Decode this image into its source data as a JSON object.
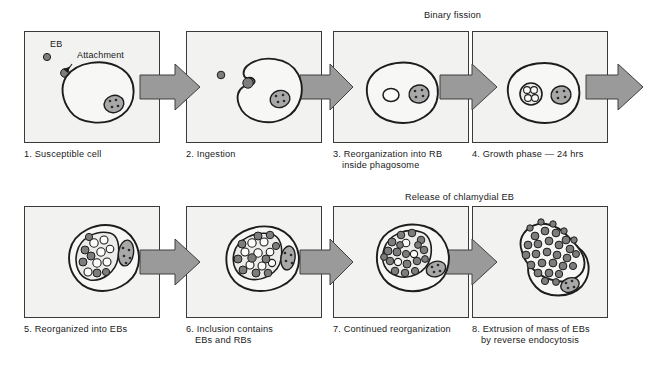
{
  "figure": {
    "title_visible": false,
    "rows": 2,
    "panels_per_row": 4
  },
  "colors": {
    "page_background": "#ffffff",
    "panel_background": "#f2f2f0",
    "panel_border": "#3a3a3a",
    "arrow_fill": "#9a9a9a",
    "arrow_stroke": "#3f3f3f",
    "cell_membrane_stroke": "#1d1d1d",
    "nucleus_fill": "#a8a8a8",
    "elementary_body_fill": "#7d7d7d",
    "reticulate_body_fill": "#fbfbfa",
    "text": "#1a1a1a"
  },
  "phase_labels": [
    {
      "text": "Binary fission",
      "row": 1
    },
    {
      "text": "Release of chlamydial EB",
      "row": 2
    }
  ],
  "annotations": [
    {
      "text": "EB",
      "panel": 1
    },
    {
      "text": "Attachment",
      "panel": 1
    }
  ],
  "panels": [
    {
      "number": "1.",
      "caption": "1. Susceptible cell",
      "caption_lines": [
        "1. Susceptible cell"
      ],
      "stage": "attachment",
      "contents": {
        "host_cell": 1,
        "nucleus": 1,
        "free_elementary_bodies": 1,
        "attached_elementary_bodies": 1,
        "inclusions": 0,
        "elementary_bodies_inside": 0,
        "reticulate_bodies_inside": 0
      }
    },
    {
      "number": "2.",
      "caption": "2. Ingestion",
      "caption_lines": [
        "2. Ingestion"
      ],
      "stage": "ingestion",
      "contents": {
        "host_cell": 1,
        "nucleus": 1,
        "free_elementary_bodies": 1,
        "engulfed_elementary_bodies": 1,
        "inclusions": 0,
        "elementary_bodies_inside": 0,
        "reticulate_bodies_inside": 0
      }
    },
    {
      "number": "3.",
      "caption": "3. Reorganization into RB inside phagosome",
      "caption_lines": [
        "3. Reorganization into RB",
        "inside phagosome"
      ],
      "stage": "reorganization-into-rb",
      "contents": {
        "host_cell": 1,
        "nucleus": 1,
        "phagosomes": 1,
        "elementary_bodies_inside": 0,
        "reticulate_bodies_inside": 1
      }
    },
    {
      "number": "4.",
      "caption": "4. Growth phase — 24 hrs",
      "caption_lines": [
        "4. Growth phase — 24 hrs"
      ],
      "stage": "growth-phase",
      "duration": "24 hrs",
      "contents": {
        "host_cell": 1,
        "nucleus": 1,
        "inclusions": 1,
        "dividing_reticulate_bodies": 4,
        "elementary_bodies_inside": 0
      }
    },
    {
      "number": "5.",
      "caption": "5. Reorganized into EBs",
      "caption_lines": [
        "5. Reorganized into EBs"
      ],
      "stage": "reorganized-into-ebs",
      "contents": {
        "host_cell": 1,
        "nucleus": 1,
        "inclusions": 1,
        "elementary_bodies_inside": 6,
        "reticulate_bodies_inside": 7
      }
    },
    {
      "number": "6.",
      "caption": "6. Inclusion contains EBs and RBs",
      "caption_lines": [
        "6. Inclusion contains",
        "EBs and RBs"
      ],
      "stage": "inclusion-contains-ebs-and-rbs",
      "contents": {
        "host_cell": 1,
        "nucleus": 1,
        "inclusions": 1,
        "elementary_bodies_inside": 10,
        "reticulate_bodies_inside": 8
      }
    },
    {
      "number": "7.",
      "caption": "7. Continued reorganization",
      "caption_lines": [
        "7. Continued reorganization"
      ],
      "stage": "continued-reorganization",
      "contents": {
        "host_cell": 1,
        "nucleus": 1,
        "inclusions": 1,
        "elementary_bodies_inside": 18,
        "reticulate_bodies_inside": 3
      }
    },
    {
      "number": "8.",
      "caption": "8. Extrusion of mass of EBs by reverse endocytosis",
      "caption_lines": [
        "8. Extrusion of mass of EBs",
        "by reverse endocytosis"
      ],
      "stage": "extrusion-by-reverse-endocytosis",
      "contents": {
        "host_cell": 1,
        "nucleus": 1,
        "extruded_lobes": 1,
        "elementary_bodies_inside": 30,
        "reticulate_bodies_inside": 0
      }
    }
  ],
  "arrows": {
    "count": 8,
    "direction": "right",
    "between": [
      "1-2",
      "2-3",
      "3-4",
      "4-out",
      "5-6",
      "6-7",
      "7-8",
      "row1-to-row2"
    ]
  }
}
